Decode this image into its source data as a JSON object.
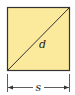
{
  "figure": {
    "shape": "square",
    "fill_color": "#FBEA9C",
    "stroke_color": "#333333",
    "diagonal_label": "d",
    "side_label": "s"
  }
}
